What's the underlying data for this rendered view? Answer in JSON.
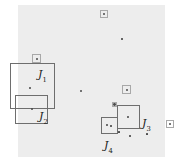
{
  "figure": {
    "background_color": "#ededed",
    "page_color": "#ffffff",
    "point_color": "#4a4a4a",
    "box_color": "#8a8a8a",
    "label_color": "#1a1a1a",
    "canvas": {
      "x": 18,
      "y": 5,
      "width": 147,
      "height": 152
    },
    "labels": [
      {
        "name": "label-j1",
        "base": "J",
        "sub": "1",
        "x": 38,
        "y": 69
      },
      {
        "name": "label-j2",
        "base": "J",
        "sub": "2",
        "x": 39,
        "y": 111
      },
      {
        "name": "label-j3",
        "base": "J",
        "sub": "3",
        "x": 142,
        "y": 118
      },
      {
        "name": "label-j4",
        "base": "J",
        "sub": "4",
        "x": 104,
        "y": 140
      }
    ],
    "boxes": [
      {
        "name": "box-j1",
        "x": 10,
        "y": 63,
        "w": 45,
        "h": 46,
        "weight": "strong"
      },
      {
        "name": "box-j2",
        "x": 15,
        "y": 95,
        "w": 33,
        "h": 29,
        "weight": "strong"
      },
      {
        "name": "box-j3",
        "x": 117,
        "y": 105,
        "w": 23,
        "h": 24,
        "weight": "strong"
      },
      {
        "name": "box-j4",
        "x": 101,
        "y": 117,
        "w": 17,
        "h": 17,
        "weight": "strong"
      },
      {
        "name": "box-top",
        "x": 100,
        "y": 10,
        "w": 8,
        "h": 8,
        "weight": "faint"
      },
      {
        "name": "box-upper-left",
        "x": 32,
        "y": 54,
        "w": 9,
        "h": 9,
        "weight": "faint"
      },
      {
        "name": "box-mid-right",
        "x": 122,
        "y": 85,
        "w": 9,
        "h": 9,
        "weight": "faint"
      },
      {
        "name": "box-j3-corner",
        "x": 112,
        "y": 102,
        "w": 5,
        "h": 5,
        "weight": "faint"
      },
      {
        "name": "box-far-right",
        "x": 166,
        "y": 120,
        "w": 8,
        "h": 8,
        "weight": "faint"
      }
    ],
    "points": [
      {
        "name": "point-top-box",
        "x": 104,
        "y": 14,
        "r": 1.1
      },
      {
        "name": "point-upper-mid",
        "x": 122,
        "y": 39,
        "r": 0.7
      },
      {
        "name": "point-upper-left-box",
        "x": 36.5,
        "y": 58.5,
        "r": 1.0
      },
      {
        "name": "point-in-j1",
        "x": 30,
        "y": 88,
        "r": 0.9
      },
      {
        "name": "point-center",
        "x": 81,
        "y": 91,
        "r": 1.3
      },
      {
        "name": "point-mid-right-box",
        "x": 126.5,
        "y": 89.5,
        "r": 1.0
      },
      {
        "name": "point-in-j2",
        "x": 32,
        "y": 109,
        "r": 1.0
      },
      {
        "name": "point-j3-corner",
        "x": 114.5,
        "y": 104.5,
        "r": 1.4
      },
      {
        "name": "point-in-j3",
        "x": 128,
        "y": 117,
        "r": 0.9
      },
      {
        "name": "point-j4-a",
        "x": 107,
        "y": 125,
        "r": 0.9
      },
      {
        "name": "point-j4-b",
        "x": 111,
        "y": 126,
        "r": 0.8
      },
      {
        "name": "point-far-right-box",
        "x": 170,
        "y": 124,
        "r": 1.0
      },
      {
        "name": "point-below-j3",
        "x": 130,
        "y": 136,
        "r": 0.7
      },
      {
        "name": "point-lower-left-j4",
        "x": 119,
        "y": 132,
        "r": 0.6
      },
      {
        "name": "point-lower-mid",
        "x": 147,
        "y": 134,
        "r": 0.6
      }
    ]
  }
}
